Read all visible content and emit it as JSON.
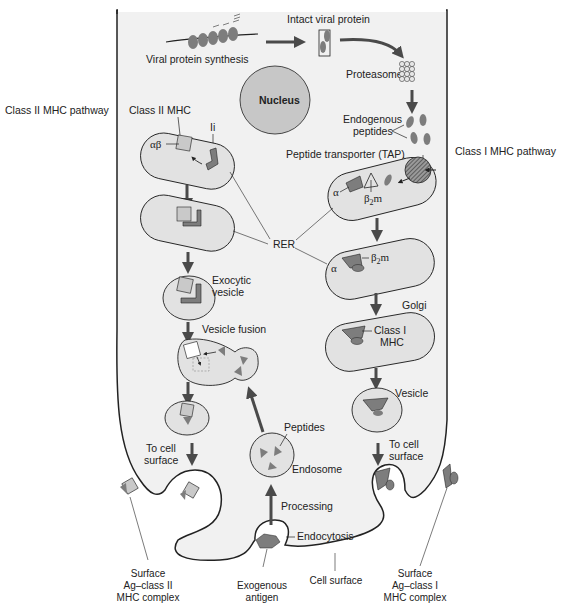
{
  "figure": {
    "type": "diagram",
    "colors": {
      "cell_fill": "#f1f1f1",
      "organelle_fill": "#e2e2e2",
      "nucleus_fill": "#c7c7c7",
      "protein_dark": "#7d7d7d",
      "protein_light": "#c9c9c9",
      "arrow": "#4a4a4a",
      "outline": "#222222"
    }
  },
  "side_labels": {
    "class2_pathway": "Class II MHC pathway",
    "class1_pathway": "Class I MHC pathway"
  },
  "top": {
    "viral_synthesis": "Viral protein synthesis",
    "intact_viral_protein": "Intact viral protein",
    "proteasome": "Proteasome",
    "endogenous_line1": "Endogenous",
    "endogenous_line2": "peptides",
    "tap": "Peptide transporter (TAP)",
    "nucleus": "Nucleus"
  },
  "class2": {
    "class2_mhc": "Class II MHC",
    "alpha_beta": "αβ",
    "ii": "Ii",
    "exocytic_line1": "Exocytic",
    "exocytic_line2": "vesicle",
    "vesicle_fusion": "Vesicle fusion",
    "to_cell_line1": "To cell",
    "to_cell_line2": "surface"
  },
  "center": {
    "rer": "RER",
    "peptides": "Peptides",
    "endosome": "Endosome",
    "processing": "Processing",
    "endocytosis": "Endocytosis"
  },
  "class1": {
    "alpha": "α",
    "beta2m_1": "β",
    "beta2m_sub": "2",
    "beta2m_m": "m",
    "golgi": "Golgi",
    "class1_line1": "Class I",
    "class1_line2": "MHC",
    "vesicle": "Vesicle",
    "to_cell_line1": "To cell",
    "to_cell_line2": "surface"
  },
  "bottom": {
    "surface2_line1": "Surface",
    "surface2_line2": "Ag–class II",
    "surface2_line3": "MHC complex",
    "exogenous_line1": "Exogenous",
    "exogenous_line2": "antigen",
    "cell_surface": "Cell surface",
    "surface1_line1": "Surface",
    "surface1_line2": "Ag–class I",
    "surface1_line3": "MHC complex"
  }
}
